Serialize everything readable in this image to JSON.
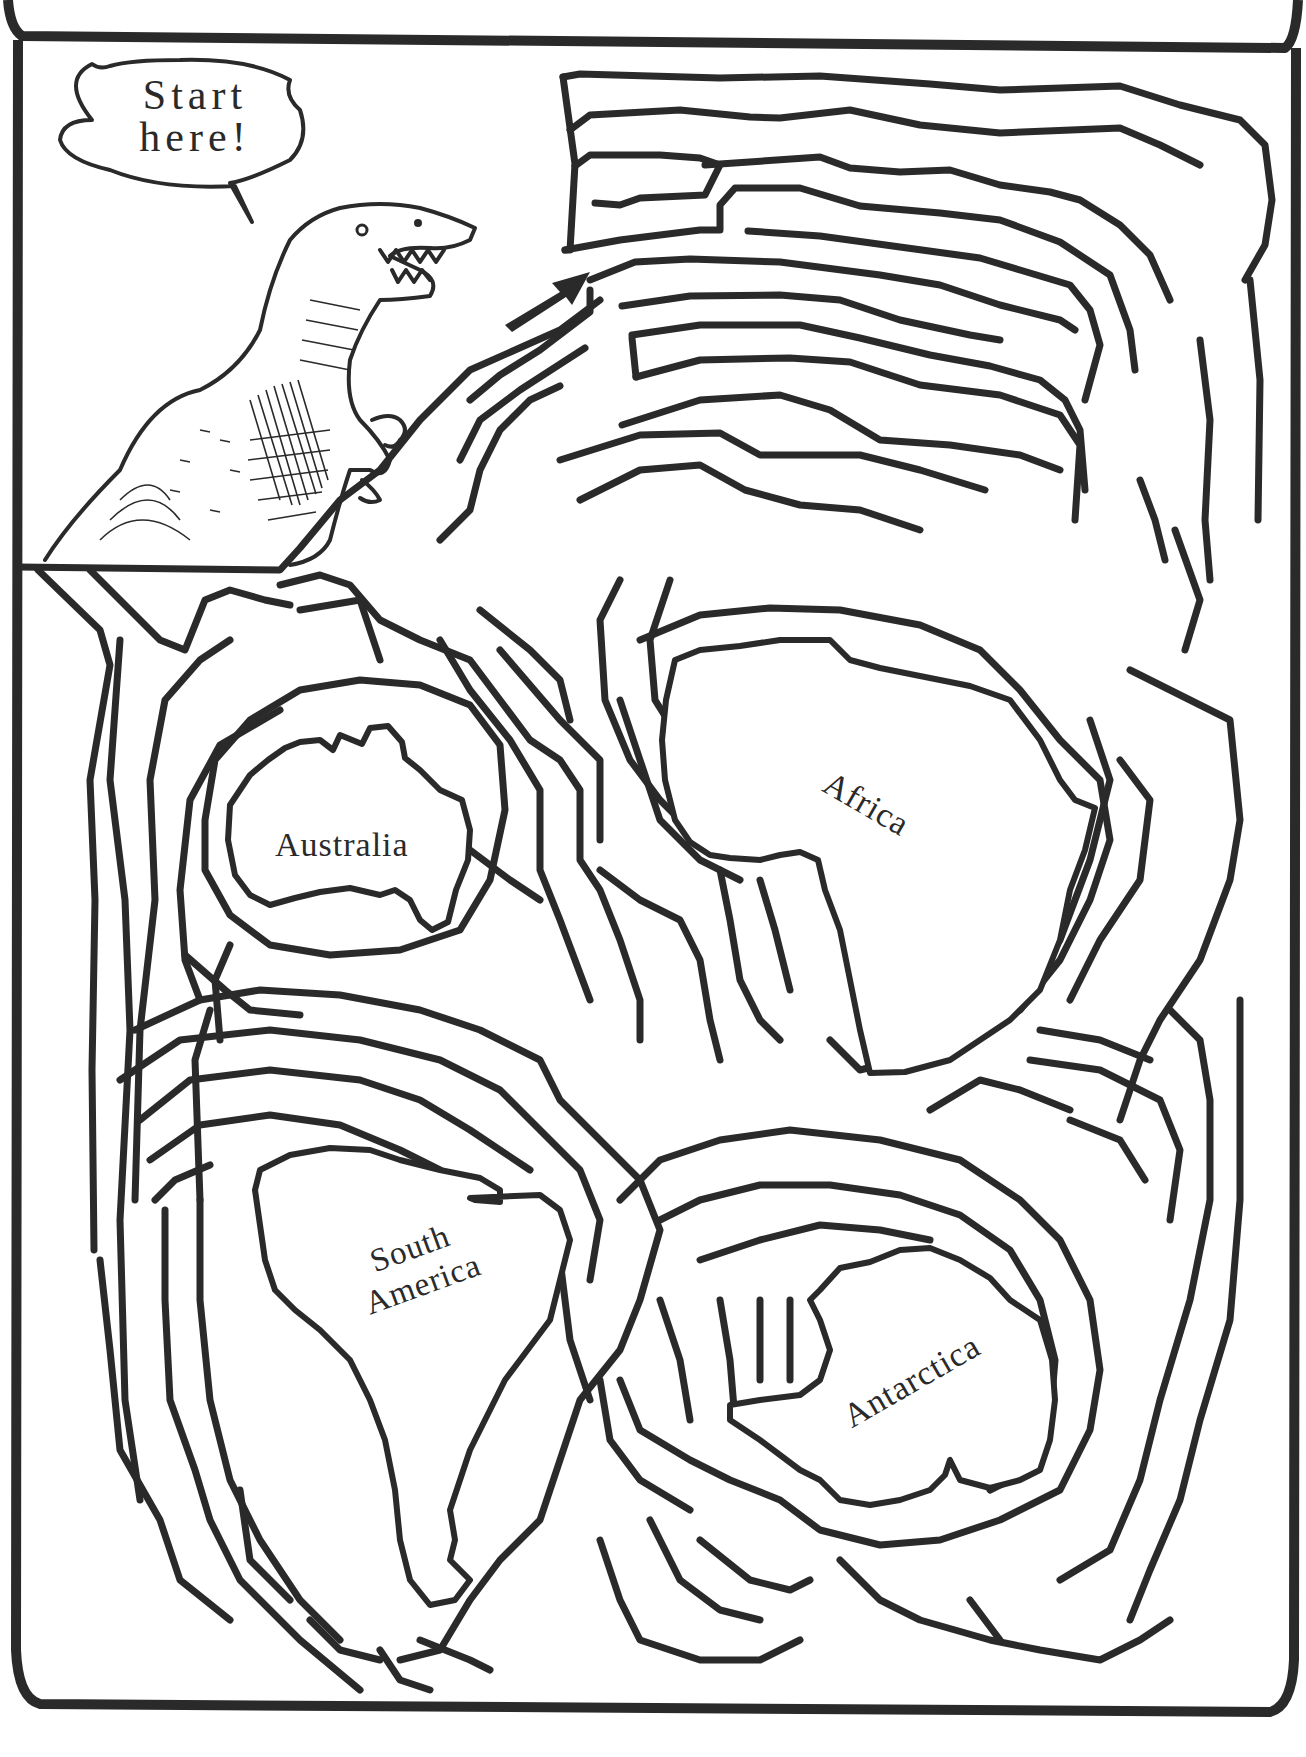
{
  "page": {
    "type": "maze-puzzle",
    "background": "#ffffff",
    "ink_color": "#2a2a2a"
  },
  "speech_bubble": {
    "line1": "Start",
    "line2": "here!"
  },
  "start_arrow": {
    "icon": "arrow-up-right-icon",
    "direction": "northeast"
  },
  "character": {
    "icon": "tyrannosaurus-illustration"
  },
  "continents": [
    {
      "name": "Australia",
      "rotation_deg": 0
    },
    {
      "name": "Africa",
      "rotation_deg": 30
    },
    {
      "name": "South America",
      "line1": "South",
      "line2": "America",
      "rotation_deg": -20
    },
    {
      "name": "Antarctica",
      "rotation_deg": -30
    }
  ]
}
